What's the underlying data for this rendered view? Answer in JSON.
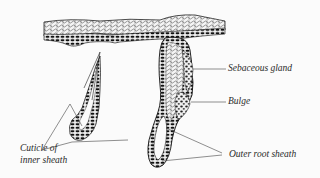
{
  "diagram": {
    "labels": {
      "sebaceous_gland": "Sebaceous gland",
      "bulge": "Bulge",
      "outer_root_sheath": "Outer root sheath",
      "cuticle_line1": "Cuticle of",
      "cuticle_line2": "inner sheath"
    },
    "colors": {
      "ink": "#1a1a1a",
      "background": "#fbfbfb",
      "leader_line": "#444444"
    }
  }
}
